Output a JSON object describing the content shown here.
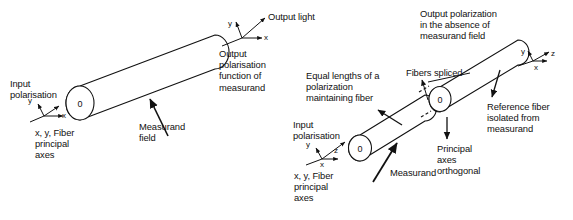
{
  "figure": {
    "title_absent": true,
    "background_color": "#ffffff",
    "line_color": "#111111",
    "text_color": "#111111",
    "fiber_end_marker": "0"
  },
  "diagram_left": {
    "name": "single-fiber-polarimetric-sensor",
    "labels": {
      "input_polarisation": "Input\npolarisation",
      "principal_axes_note": "x, y, Fiber\nprincipal\naxes",
      "measurand_field": "Measurand\nfield",
      "output_light": "Output light",
      "output_polarisation_note": "Output\npolarisation\nfunction of\nmeasurand"
    },
    "axes_input": {
      "y": "y",
      "x": "x"
    },
    "axes_output": {
      "y": "y",
      "x": "x"
    },
    "endcap_label": "0"
  },
  "diagram_right": {
    "name": "dual-spliced-fiber-reference-sensor",
    "labels": {
      "output_polarization_note": "Output polarization\nin the absence of\nmeasurand field",
      "equal_lengths_note": "Equal lengths of a\npolarization\nmaintaining fiber",
      "fibers_spliced": "Fibers spliced",
      "reference_fiber_note": "Reference fiber\nisolated from\nmeasurand",
      "input_polarisation": "Input\npolarisation",
      "principal_axes_note": "x, y, Fiber\nprincipal\naxes",
      "measurand": "Measurand",
      "principal_axes_orthogonal": "Principal\naxes\northogonal"
    },
    "axes_input": {
      "y": "y",
      "z": "z",
      "x": "x"
    },
    "axes_output": {
      "y": "y",
      "z": "z",
      "x": "x"
    },
    "endcap_label_first": "0",
    "endcap_label_second": "0"
  }
}
